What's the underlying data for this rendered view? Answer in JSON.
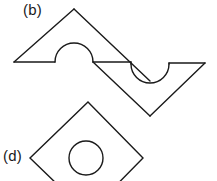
{
  "figure": {
    "background_color": "#ffffff",
    "stroke_color": "#1a1a1a",
    "stroke_width": 1.4,
    "width": 217,
    "height": 181,
    "labels": [
      {
        "id": "b",
        "text": "(b)",
        "x": 23,
        "y": 1
      },
      {
        "id": "d",
        "text": "(d)",
        "x": 3,
        "y": 147
      }
    ],
    "shapes": [
      {
        "name": "zigzag-polygon-with-arcs",
        "label": "(b)",
        "description": "Z-shaped polygon with a convex semicircular bump on the upper horizontal edge and a concave semicircular notch on the lower horizontal edge",
        "path": "M 14 62 L 74 9 L 131 63 L 169 82 L 150 116 L 93 62 Z",
        "vertices": [
          {
            "x": 14,
            "y": 62
          },
          {
            "x": 74,
            "y": 9
          },
          {
            "x": 131,
            "y": 63
          },
          {
            "x": 169,
            "y": 82
          },
          {
            "x": 150,
            "y": 116
          },
          {
            "x": 93,
            "y": 62
          },
          {
            "x": 205,
            "y": 63
          }
        ],
        "arcs": [
          {
            "type": "convex-semicircle",
            "cx": 74,
            "cy": 62,
            "r": 19,
            "direction": "up"
          },
          {
            "type": "concave-semicircle",
            "cx": 150,
            "cy": 63,
            "r": 19,
            "direction": "down"
          }
        ]
      },
      {
        "name": "diamond-with-circle",
        "label": "(d)",
        "description": "Rotated square (diamond) containing a concentric circle, clipped by the bottom image edge",
        "vertices": [
          {
            "x": 88,
            "y": 102
          },
          {
            "x": 143,
            "y": 158
          },
          {
            "x": 88,
            "y": 214
          },
          {
            "x": 30,
            "y": 158
          }
        ],
        "inner_circle": {
          "cx": 86,
          "cy": 158,
          "r": 17
        }
      }
    ]
  }
}
